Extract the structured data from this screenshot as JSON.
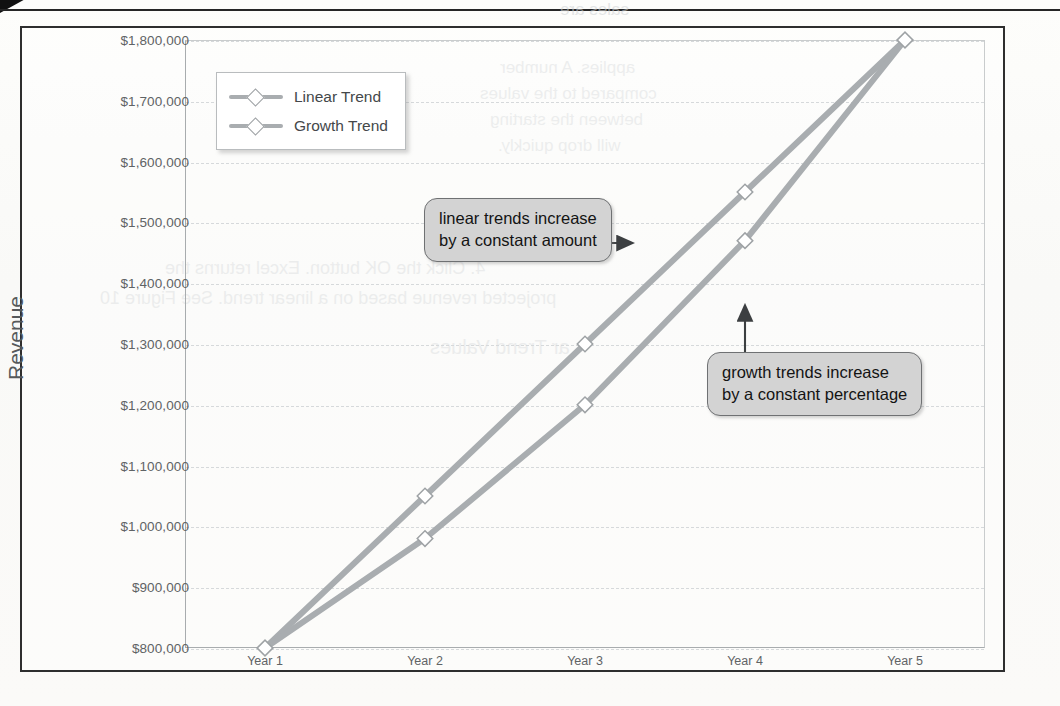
{
  "figure": {
    "frame_present": true
  },
  "chart_data": {
    "type": "line",
    "title": "",
    "xlabel": "",
    "ylabel": "Revenue",
    "categories": [
      "Year 1",
      "Year 2",
      "Year 3",
      "Year 4",
      "Year 5"
    ],
    "series": [
      {
        "name": "Linear Trend",
        "values": [
          800000,
          1050000,
          1300000,
          1550000,
          1800000
        ],
        "marker": "diamond",
        "color": "#a9adb0"
      },
      {
        "name": "Growth Trend",
        "values": [
          800000,
          980000,
          1200000,
          1470000,
          1800000
        ],
        "marker": "diamond",
        "color": "#a9adb0"
      }
    ],
    "ylim": [
      800000,
      1800000
    ],
    "ytick_values": [
      800000,
      900000,
      1000000,
      1100000,
      1200000,
      1300000,
      1400000,
      1500000,
      1600000,
      1700000,
      1800000
    ],
    "ytick_labels": [
      "$800,000",
      "$900,000",
      "$1,000,000",
      "$1,100,000",
      "$1,200,000",
      "$1,300,000",
      "$1,400,000",
      "$1,500,000",
      "$1,600,000",
      "$1,700,000",
      "$1,800,000"
    ],
    "grid": true,
    "grid_style": "dashed-horizontal",
    "legend_position": "top-left-inside",
    "annotations": [
      {
        "text": "linear trends increase\nby a constant amount",
        "points_to": "Linear Trend",
        "arrow": "right"
      },
      {
        "text": "growth trends increase\nby a constant percentage",
        "points_to": "Growth Trend",
        "arrow": "up"
      }
    ]
  },
  "legend": {
    "items": [
      {
        "label": "Linear Trend"
      },
      {
        "label": "Growth Trend"
      }
    ]
  },
  "axis": {
    "y_title": "Revenue"
  },
  "callouts": {
    "linear": "linear trends increase\nby a constant amount",
    "growth": "growth trends increase\nby a constant percentage"
  },
  "background_bleed": [
    "sales are",
    "applies. A number",
    "compared to the values",
    "between the starting",
    "will drop quickly.",
    "4. Click the OK button. Excel returns the",
    "projected revenue based on a linear trend. See Figure 10",
    "ar Trend Values"
  ]
}
